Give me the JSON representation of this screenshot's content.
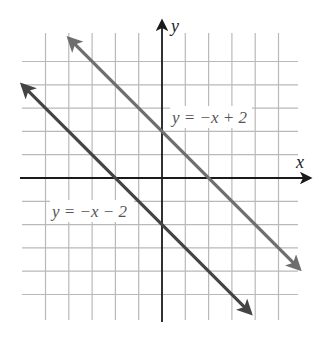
{
  "figure": {
    "type": "coordinate-plane-graph",
    "axes": {
      "x_label": "x",
      "y_label": "y",
      "x_range": [
        -6,
        6
      ],
      "y_range": [
        -6,
        6
      ],
      "grid": true,
      "grid_step": 1
    },
    "lines": [
      {
        "id": "upper",
        "equation_label": "y = −x + 2",
        "slope": -1,
        "intercept": 2,
        "color": "#6e6e6e",
        "x_from": -4,
        "x_to": 5.9
      },
      {
        "id": "lower",
        "equation_label": "y = −x − 2",
        "slope": -1,
        "intercept": -2,
        "color": "#444444",
        "x_from": -6,
        "x_to": 3.8
      }
    ]
  },
  "chart_data": {
    "type": "line",
    "title": "",
    "xlabel": "x",
    "ylabel": "y",
    "xlim": [
      -6,
      6
    ],
    "ylim": [
      -6,
      6
    ],
    "grid": true,
    "series": [
      {
        "name": "y = −x + 2",
        "x": [
          -4,
          0,
          2,
          5.9
        ],
        "y": [
          6,
          2,
          0,
          -3.9
        ]
      },
      {
        "name": "y = −x − 2",
        "x": [
          -6,
          -2,
          0,
          3.8
        ],
        "y": [
          4,
          0,
          -2,
          -5.8
        ]
      }
    ],
    "annotations": [
      {
        "text": "y = −x + 2",
        "x": 0.5,
        "y": 2.6
      },
      {
        "text": "y = −x − 2",
        "x": -4.7,
        "y": -1.4
      }
    ]
  }
}
